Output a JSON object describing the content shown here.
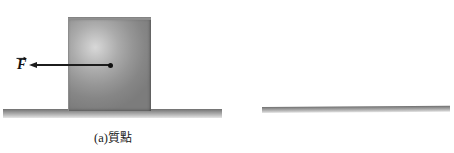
{
  "figure": {
    "type": "physics-diagram",
    "background_color": "#ffffff",
    "ink_color": "#1c1c1c",
    "body_fill_color": "#9a9a9a",
    "ground_color": "#a8a8a8"
  },
  "panels": [
    {
      "id": "a",
      "label": "(a)",
      "caption_cjk": "質點",
      "caption_full": "(a)質點",
      "body_shape": "block",
      "force": {
        "symbol": "F",
        "notation": "vector",
        "direction": "left",
        "applied_at": "center of mass"
      },
      "ground": "horizontal-surface"
    },
    {
      "id": "b",
      "label": "(b)",
      "caption_cjk": "剛體",
      "caption_full": "(b)剛體",
      "body_shape": "sphere",
      "force": {
        "symbol": "F",
        "notation": "vector",
        "direction": "left",
        "applied_at": "center of mass"
      },
      "ground": "horizontal-surface"
    }
  ]
}
